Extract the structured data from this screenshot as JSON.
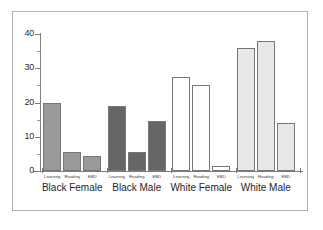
{
  "chart_data": {
    "type": "bar",
    "title": "",
    "subtitle": "",
    "xlabel": "",
    "ylabel": "",
    "ylim": [
      0,
      40
    ],
    "y_ticks": [
      0,
      10,
      20,
      30,
      40
    ],
    "y_tick_labels": [
      "0",
      "10",
      "20",
      "30",
      "40"
    ],
    "y_minor_ticks": [
      5,
      15,
      25,
      35
    ],
    "grid": false,
    "legend_position": "none",
    "categories": [
      "Black Female",
      "Black Male",
      "White Female",
      "White Male"
    ],
    "subcategories": [
      "Learning",
      "Reading",
      "EBD"
    ],
    "series": [
      {
        "name": "Learning",
        "values": [
          20,
          19,
          27.5,
          36
        ]
      },
      {
        "name": "Reading",
        "values": [
          5.5,
          5.5,
          25,
          38
        ]
      },
      {
        "name": "EBD",
        "values": [
          4.5,
          14.5,
          1.5,
          14
        ]
      }
    ],
    "group_colors": [
      "#999999",
      "#666666",
      "#ffffff",
      "#e8e8e8"
    ],
    "bar_edge_color": "#777777",
    "axis_color": "#7d7d7d",
    "frame_color": "#b3b3b3",
    "background_color": "#ffffff"
  },
  "axis": {
    "y_labels": [
      "40",
      "30",
      "20",
      "10",
      "0"
    ]
  },
  "groups": [
    {
      "label": "Black Female",
      "color": "#999999",
      "bars": [
        {
          "label": "Learning",
          "value": 20
        },
        {
          "label": "Reading",
          "value": 5.5
        },
        {
          "label": "EBD",
          "value": 4.5
        }
      ]
    },
    {
      "label": "Black Male",
      "color": "#666666",
      "bars": [
        {
          "label": "Learning",
          "value": 19
        },
        {
          "label": "Reading",
          "value": 5.5
        },
        {
          "label": "EBD",
          "value": 14.5
        }
      ]
    },
    {
      "label": "White Female",
      "color": "#ffffff",
      "bars": [
        {
          "label": "Learning",
          "value": 27.5
        },
        {
          "label": "Reading",
          "value": 25
        },
        {
          "label": "EBD",
          "value": 1.5
        }
      ]
    },
    {
      "label": "White Male",
      "color": "#e8e8e8",
      "bars": [
        {
          "label": "Learning",
          "value": 36
        },
        {
          "label": "Reading",
          "value": 38
        },
        {
          "label": "EBD",
          "value": 14
        }
      ]
    }
  ]
}
